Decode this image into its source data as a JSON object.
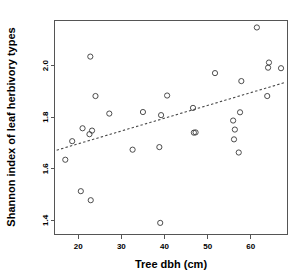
{
  "chart_data": {
    "type": "scatter",
    "title": "",
    "subtitle": "",
    "xlabel": "Tree dbh (cm)",
    "ylabel": "Shannon index of leaf herbivory types",
    "xlim": [
      14.5,
      68.5
    ],
    "ylim": [
      1.345,
      2.175
    ],
    "xticks": [
      20,
      30,
      40,
      50,
      60
    ],
    "xtick_labels": [
      "20",
      "30",
      "40",
      "50",
      "60"
    ],
    "yticks": [
      1.4,
      1.6,
      1.8,
      2.0
    ],
    "ytick_labels": [
      "1.4",
      "1.6",
      "1.8",
      "2.0"
    ],
    "grid": false,
    "legend": null,
    "marker": "open-circle",
    "marker_color": "#3a3a3a",
    "points": [
      {
        "x": 17.0,
        "y": 1.635
      },
      {
        "x": 18.6,
        "y": 1.707
      },
      {
        "x": 20.6,
        "y": 1.513
      },
      {
        "x": 21.0,
        "y": 1.757
      },
      {
        "x": 22.6,
        "y": 1.734
      },
      {
        "x": 22.8,
        "y": 2.035
      },
      {
        "x": 22.9,
        "y": 1.478
      },
      {
        "x": 23.2,
        "y": 1.748
      },
      {
        "x": 24.0,
        "y": 1.882
      },
      {
        "x": 27.2,
        "y": 1.814
      },
      {
        "x": 32.6,
        "y": 1.674
      },
      {
        "x": 35.0,
        "y": 1.82
      },
      {
        "x": 38.8,
        "y": 1.684
      },
      {
        "x": 39.0,
        "y": 1.39
      },
      {
        "x": 39.2,
        "y": 1.808
      },
      {
        "x": 40.6,
        "y": 1.884
      },
      {
        "x": 46.6,
        "y": 1.836
      },
      {
        "x": 46.8,
        "y": 1.74
      },
      {
        "x": 47.2,
        "y": 1.741
      },
      {
        "x": 51.7,
        "y": 1.971
      },
      {
        "x": 55.9,
        "y": 1.787
      },
      {
        "x": 56.1,
        "y": 1.714
      },
      {
        "x": 56.3,
        "y": 1.752
      },
      {
        "x": 57.2,
        "y": 1.663
      },
      {
        "x": 57.5,
        "y": 1.819
      },
      {
        "x": 57.8,
        "y": 1.94
      },
      {
        "x": 61.4,
        "y": 2.148
      },
      {
        "x": 63.8,
        "y": 1.882
      },
      {
        "x": 64.0,
        "y": 1.992
      },
      {
        "x": 64.2,
        "y": 2.012
      },
      {
        "x": 67.0,
        "y": 1.99
      }
    ],
    "trend_line": {
      "style": "dashed",
      "color": "#4a4a4a",
      "x_start": 15.0,
      "y_start": 1.672,
      "x_end": 68.0,
      "y_end": 1.935
    }
  },
  "axes": {
    "x_title": "Tree dbh (cm)",
    "y_title": "Shannon index of leaf herbivory types"
  }
}
